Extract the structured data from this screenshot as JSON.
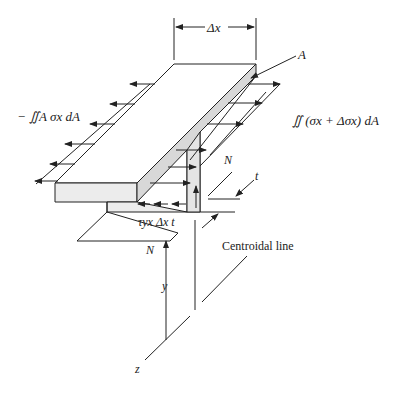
{
  "diagram": {
    "labels": {
      "delta_x": "Δx",
      "area": "A",
      "left_force": "− ∬A σx dA",
      "right_force": "∬ (σx + Δσx) dA",
      "neutral_top": "N",
      "thickness": "t",
      "shear": "τyx Δx t",
      "neutral_bottom": "N",
      "y_axis": "y",
      "z_axis": "z",
      "centroidal": "Centroidal line"
    },
    "colors": {
      "line": "#222222",
      "shade": "#d8d8d8",
      "face": "#ececec"
    }
  }
}
